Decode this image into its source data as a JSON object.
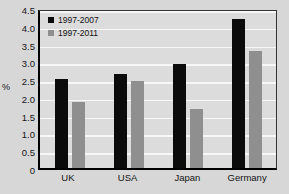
{
  "chart_data": {
    "type": "bar",
    "title": "",
    "xlabel": "",
    "ylabel": "%",
    "categories": [
      "UK",
      "USA",
      "Japan",
      "Germany"
    ],
    "series": [
      {
        "name": "1997-2007",
        "color": "#0b0b0b",
        "values": [
          2.5,
          2.65,
          2.93,
          4.2
        ]
      },
      {
        "name": "1997-2011",
        "color": "#8f8f8f",
        "values": [
          1.85,
          2.45,
          1.67,
          3.3
        ]
      }
    ],
    "ylim": [
      0,
      4.5
    ],
    "ytick_values": [
      0,
      0.5,
      1.0,
      1.5,
      2.0,
      2.5,
      3.0,
      3.5,
      4.0,
      4.5
    ],
    "ytick_labels": [
      "0",
      "0.5",
      "1.0",
      "1.5",
      "2.0",
      "2.5",
      "3.0",
      "3.5",
      "4.0",
      "4.5"
    ],
    "grid": true,
    "grid_color": "#f7f7f7",
    "legend_position": "top-left-inside",
    "plot_background": "#dcdcdc",
    "figure_background": "#d7d7d7",
    "axis_color": "#000000"
  }
}
